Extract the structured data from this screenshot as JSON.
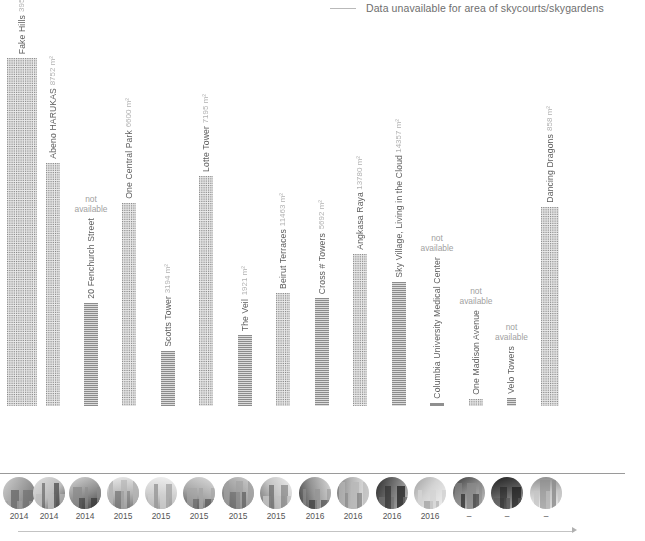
{
  "legend": {
    "marker": "horizontal-line",
    "label": "Data unavailable for area of skycourts/skygardens"
  },
  "axis": {
    "baseline_color": "#9a9a9a",
    "timeline_arrow": "arrow-right"
  },
  "chart_data": {
    "type": "bar",
    "title": "",
    "xlabel": "",
    "ylabel": "",
    "grid": false,
    "legend_position": "top-right",
    "unit": "m²",
    "categories": [
      "Fake Hills",
      "Abeno HARUKAS",
      "20 Fenchurch Street",
      "One Central Park",
      "Scotts Tower",
      "Lotte Tower",
      "The Veil",
      "Beirut Terraces",
      "Cross # Towers",
      "Angkasa Raya",
      "Sky Village, Living in the Cloud",
      "Columbia University Medical Center",
      "One Madison Avenue",
      "Velo Towers",
      "Dancing Dragons"
    ],
    "values": [
      35395,
      8752,
      null,
      6600,
      3194,
      7195,
      1921,
      11463,
      5692,
      13780,
      14357,
      null,
      null,
      null,
      858
    ],
    "value_labels": [
      "395 m²",
      "8752 m²",
      "not available",
      "6600 m²",
      "3194 m²",
      "7195 m²",
      "1921 m²",
      "11463 m²",
      "5692 m²",
      "13780 m²",
      "14357 m²",
      "not available",
      "not available",
      "not available",
      "858 m²"
    ],
    "ylim": [
      0,
      400
    ]
  },
  "bars": [
    {
      "name": "Fake Hills",
      "value_label": "395 m²",
      "available": true,
      "x": 7,
      "width": 30,
      "height": 348,
      "texture": "dense"
    },
    {
      "name": "Abeno HARUKAS",
      "value_label": "8752 m²",
      "available": true,
      "x": 46,
      "width": 14,
      "height": 243,
      "texture": "dense"
    },
    {
      "name": "20 Fenchurch Street",
      "value_label": "not available",
      "available": false,
      "x": 84,
      "width": 14,
      "height": 103,
      "texture": "solidish"
    },
    {
      "name": "One Central Park",
      "value_label": "6600 m²",
      "available": true,
      "x": 122,
      "width": 14,
      "height": 203,
      "texture": "dense"
    },
    {
      "name": "Scotts Tower",
      "value_label": "3194 m²",
      "available": true,
      "x": 161,
      "width": 14,
      "height": 55,
      "texture": "solidish"
    },
    {
      "name": "Lotte Tower",
      "value_label": "7195 m²",
      "available": true,
      "x": 199,
      "width": 14,
      "height": 230,
      "texture": "dense"
    },
    {
      "name": "The Veil",
      "value_label": "1921 m²",
      "available": true,
      "x": 238,
      "width": 14,
      "height": 71,
      "texture": "solidish"
    },
    {
      "name": "Beirut Terraces",
      "value_label": "11463 m²",
      "available": true,
      "x": 276,
      "width": 14,
      "height": 113,
      "texture": "dense"
    },
    {
      "name": "Cross # Towers",
      "value_label": "5692 m²",
      "available": true,
      "x": 315,
      "width": 14,
      "height": 108,
      "texture": "solidish"
    },
    {
      "name": "Angkasa Raya",
      "value_label": "13780 m²",
      "available": true,
      "x": 353,
      "width": 14,
      "height": 152,
      "texture": "dense"
    },
    {
      "name": "Sky Village, Living in the Cloud",
      "value_label": "14357 m²",
      "available": true,
      "x": 392,
      "width": 14,
      "height": 124,
      "texture": "solidish"
    },
    {
      "name": "Columbia University Medical Center",
      "value_label": "not available",
      "available": false,
      "x": 430,
      "width": 14,
      "height": 3,
      "texture": "stub"
    },
    {
      "name": "One Madison Avenue",
      "value_label": "not available",
      "available": false,
      "x": 469,
      "width": 14,
      "height": 7,
      "texture": "dense"
    },
    {
      "name": "Velo Towers",
      "value_label": "not available",
      "available": false,
      "x": 507,
      "width": 9,
      "height": 8,
      "texture": "solidish"
    },
    {
      "name": "Dancing Dragons",
      "value_label": "858 m²",
      "available": true,
      "x": 541,
      "width": 18,
      "height": 199,
      "texture": "dense"
    }
  ],
  "timeline": [
    {
      "year": "2014",
      "x": 3,
      "photo": "tower-photo"
    },
    {
      "year": "2014",
      "x": 33,
      "photo": "tower-photo"
    },
    {
      "year": "2014",
      "x": 69,
      "photo": "tower-photo"
    },
    {
      "year": "2015",
      "x": 107,
      "photo": "tower-photo"
    },
    {
      "year": "2015",
      "x": 145,
      "photo": "tower-photo"
    },
    {
      "year": "2015",
      "x": 183,
      "photo": "tower-photo"
    },
    {
      "year": "2015",
      "x": 222,
      "photo": "tower-photo"
    },
    {
      "year": "2015",
      "x": 260,
      "photo": "tower-photo"
    },
    {
      "year": "2016",
      "x": 299,
      "photo": "tower-photo"
    },
    {
      "year": "2016",
      "x": 337,
      "photo": "tower-photo"
    },
    {
      "year": "2016",
      "x": 376,
      "photo": "tower-photo"
    },
    {
      "year": "2016",
      "x": 414,
      "photo": "tower-photo"
    },
    {
      "year": "–",
      "x": 453,
      "photo": "tower-photo"
    },
    {
      "year": "–",
      "x": 491,
      "photo": "tower-photo"
    },
    {
      "year": "–",
      "x": 530,
      "photo": "tower-photo"
    }
  ]
}
